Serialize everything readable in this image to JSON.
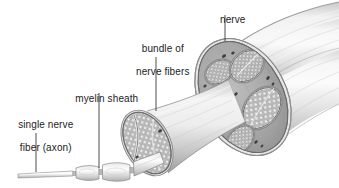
{
  "figure": {
    "style": "grayscale anatomical illustration",
    "width": 339,
    "height": 188,
    "background_color": "#ffffff"
  },
  "labels": {
    "nerve": "nerve",
    "bundle_line1": "bundle of",
    "bundle_line2": "nerve fibers",
    "myelin": "myelin sheath",
    "single_fiber_line1": "single nerve",
    "single_fiber_line2": "fiber (axon)"
  },
  "colors": {
    "text": "#1c1c1c",
    "leader_line": "#3a3a3a",
    "nerve_body_light": "#f2f2f2",
    "nerve_body_mid": "#d2d2d2",
    "nerve_body_shadow": "#a8a8a8",
    "epineurium": "#9a9a9a",
    "perineurium": "#6f6f6f",
    "fascicle_fill": "#c8c8c8",
    "fiber_circle": "#efefef",
    "fiber_outline": "#8a8a8a",
    "vessel_dark": "#3d3d3d",
    "outline": "#5a5a5a"
  },
  "leaders": [
    {
      "name": "nerve-leader",
      "x1": 225,
      "y1": 15,
      "x2": 225,
      "y2": 41
    },
    {
      "name": "bundle-leader",
      "x1": 156,
      "y1": 57,
      "x2": 156,
      "y2": 111
    },
    {
      "name": "myelin-leader",
      "x1": 99,
      "y1": 93,
      "x2": 99,
      "y2": 168
    },
    {
      "name": "single-fiber-leader",
      "x1": 36,
      "y1": 133,
      "x2": 36,
      "y2": 172
    }
  ],
  "structures": [
    {
      "name": "whole-nerve-trunk",
      "description": "large cylindrical nerve trunk running to upper right, cut open at left end"
    },
    {
      "name": "nerve-cross-section",
      "description": "elliptical cut face showing several fascicles embedded in epineurium"
    },
    {
      "name": "fascicle-tube",
      "description": "single bundle of nerve fibers pulled out of the trunk toward lower left"
    },
    {
      "name": "fascicle-cross-section",
      "description": "elliptical cut face of the bundle packed with circular nerve fibers"
    },
    {
      "name": "single-axon",
      "description": "one myelinated nerve fiber extending to the lower left with segmented myelin sheath and nodes of Ranvier"
    }
  ]
}
